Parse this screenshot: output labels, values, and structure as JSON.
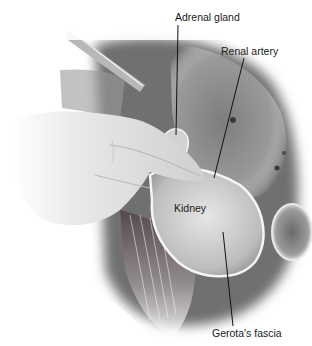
{
  "figure": {
    "style": "grayscale surgical illustration",
    "labels": [
      {
        "id": "adrenal-gland",
        "text": "Adrenal gland",
        "x": 175,
        "y": 11,
        "leader": [
          [
            178,
            25
          ],
          [
            176,
            135
          ]
        ]
      },
      {
        "id": "renal-artery",
        "text": "Renal artery",
        "x": 221,
        "y": 45,
        "leader": [
          [
            244,
            58
          ],
          [
            214,
            178
          ]
        ]
      },
      {
        "id": "kidney",
        "text": "Kidney",
        "x": 174,
        "y": 202,
        "leader": null
      },
      {
        "id": "gerotas-fascia",
        "text": "Gerota's fascia",
        "x": 212,
        "y": 327,
        "leader": [
          [
            233,
            326
          ],
          [
            223,
            232
          ]
        ]
      }
    ],
    "colors": {
      "background": "#ffffff",
      "label_text": "#1a1a1a",
      "leader_line": "#111111",
      "liver": "#8a8a8a",
      "kidney": "#d6d6d6",
      "hand": "#e4e4e4",
      "muscle_dark": "#5a4a4e"
    }
  }
}
